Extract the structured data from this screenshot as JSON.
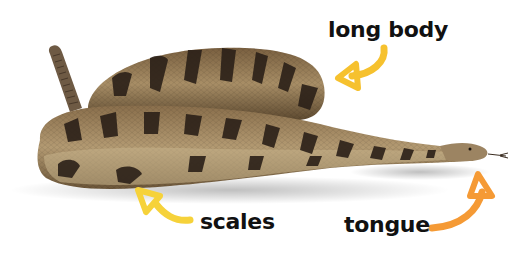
{
  "image": {
    "subject": "rattlesnake",
    "background": "#ffffff"
  },
  "labels": [
    {
      "id": "long-body",
      "text": "long body",
      "arrow_color": "#f6c12e"
    },
    {
      "id": "scales",
      "text": "scales",
      "arrow_color": "#f6d23a"
    },
    {
      "id": "tongue",
      "text": "tongue",
      "arrow_color": "#f59a35"
    }
  ],
  "colors": {
    "snake_light": "#b8a07a",
    "snake_mid": "#8a6f4c",
    "snake_dark": "#2b2018",
    "label_text": "#111111"
  }
}
